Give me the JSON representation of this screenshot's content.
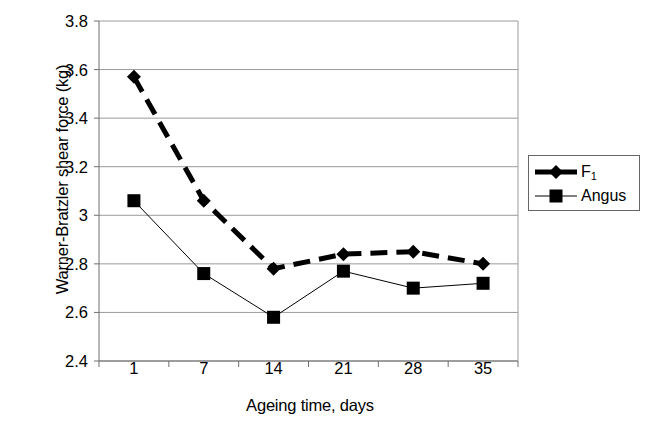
{
  "chart_data": {
    "type": "line",
    "title": "",
    "xlabel": "Ageing time, days",
    "ylabel": "Warner-Bratzler shear force (kg)",
    "categories": [
      "1",
      "7",
      "14",
      "21",
      "28",
      "35"
    ],
    "x_tick_labels": [
      "1",
      "7",
      "14",
      "21",
      "28",
      "35"
    ],
    "y_tick_labels": [
      "3.8",
      "3.6",
      "3.4",
      "3.2",
      "3",
      "2.8",
      "2.6",
      "2.4"
    ],
    "y_tick_values": [
      3.8,
      3.6,
      3.4,
      3.2,
      3.0,
      2.8,
      2.6,
      2.4
    ],
    "ylim": [
      2.4,
      3.8
    ],
    "grid": "horizontal",
    "legend_position": "right",
    "series": [
      {
        "name": "F1",
        "label_html": "F<sub>1</sub>",
        "marker": "diamond",
        "line_style": "dashed",
        "line_width": 5,
        "color": "#000000",
        "values": [
          3.57,
          3.06,
          2.78,
          2.84,
          2.85,
          2.8
        ]
      },
      {
        "name": "Angus",
        "label_html": "Angus",
        "marker": "square",
        "line_style": "solid",
        "line_width": 1,
        "color": "#000000",
        "values": [
          3.06,
          2.76,
          2.58,
          2.77,
          2.7,
          2.72
        ]
      }
    ]
  },
  "legend": {
    "items": [
      {
        "label": "F1",
        "marker": "diamond",
        "line_style": "dashed"
      },
      {
        "label": "Angus",
        "marker": "square",
        "line_style": "solid"
      }
    ]
  },
  "axes": {
    "y_title": "Warner-Bratzler shear force (kg)",
    "x_title": "Ageing time, days"
  },
  "colors": {
    "series": "#000000",
    "gridline": "#9a9a9a",
    "axis": "#6f6f6f",
    "background": "#ffffff"
  }
}
